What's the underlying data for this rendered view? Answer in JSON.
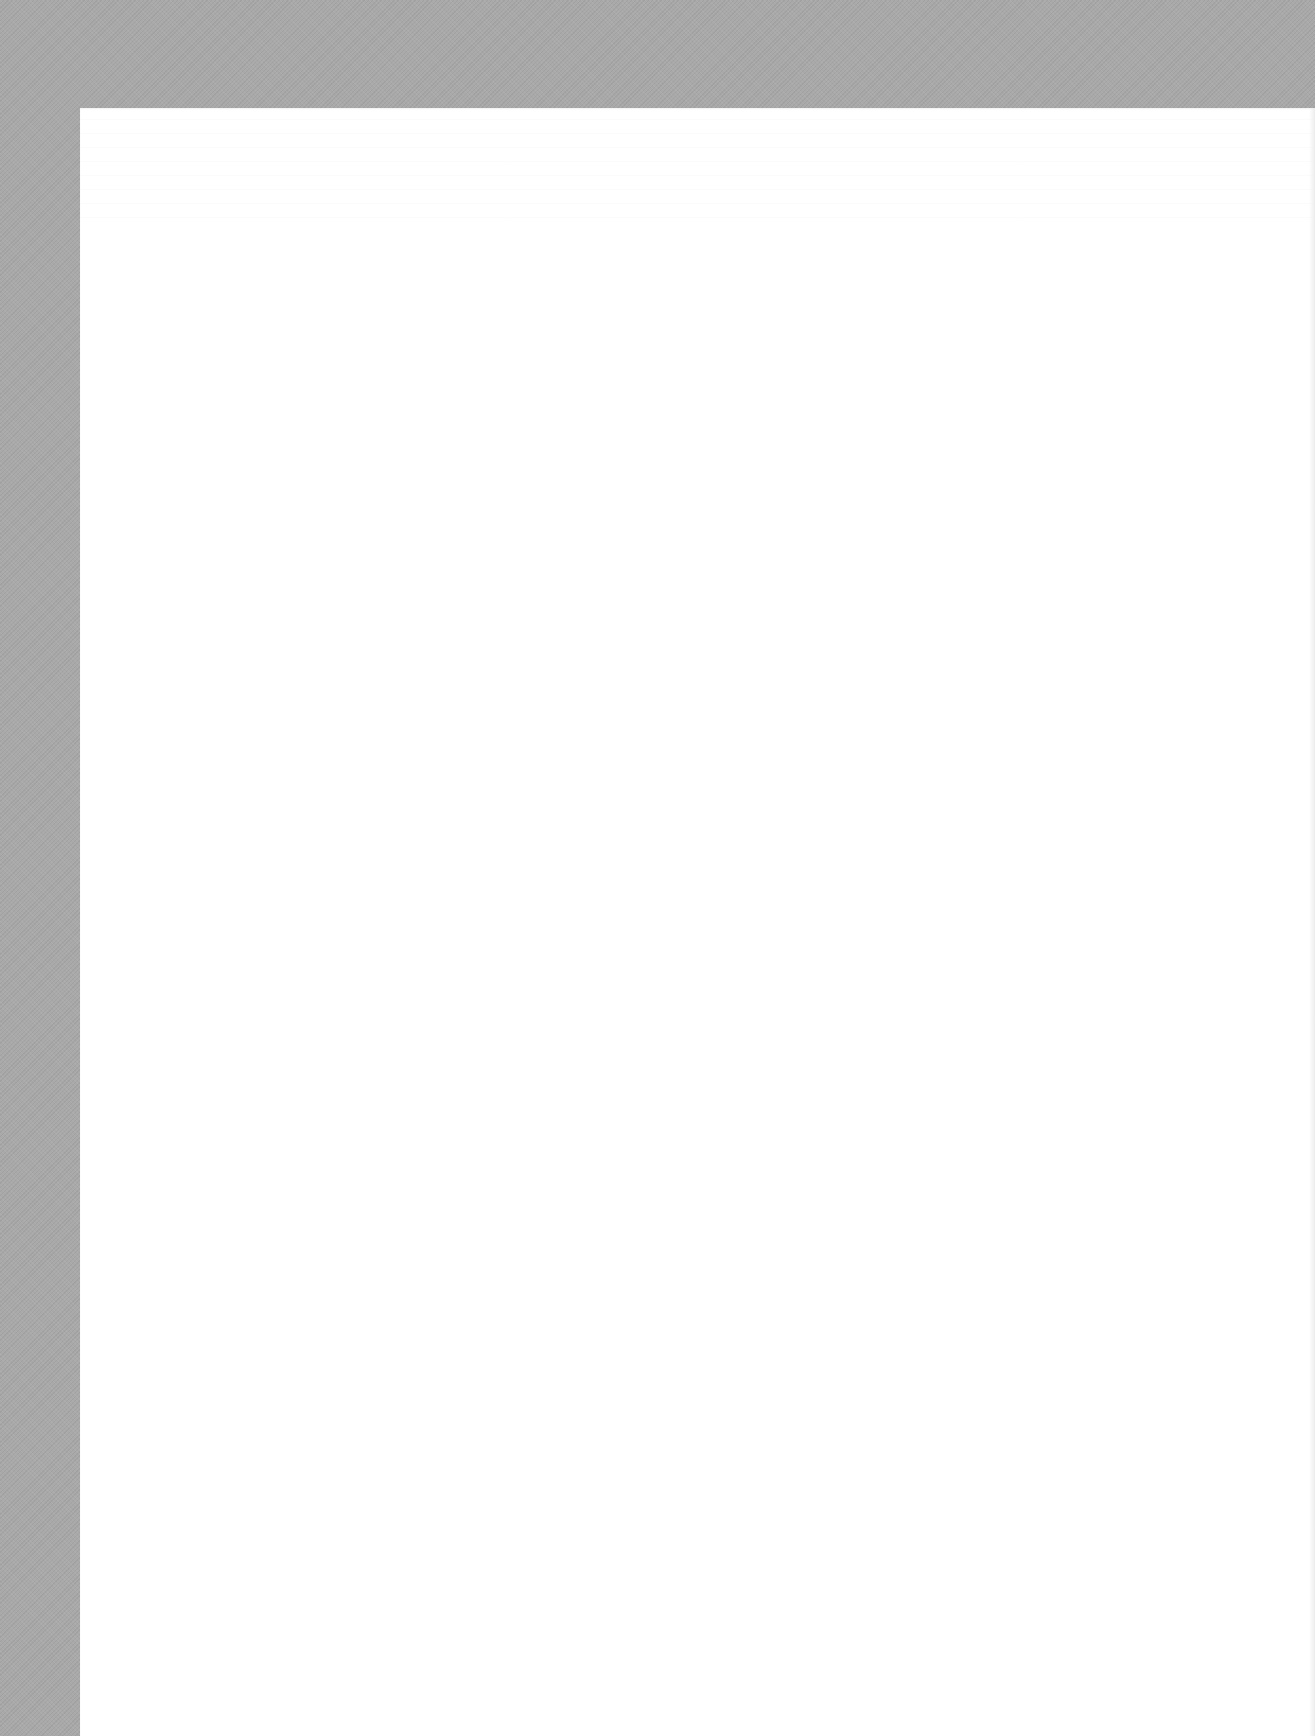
{
  "document": {
    "type": "scanned-page",
    "page_text": "",
    "colors": {
      "scan_border": "#a9a9a9",
      "page": "#ffffff"
    }
  }
}
